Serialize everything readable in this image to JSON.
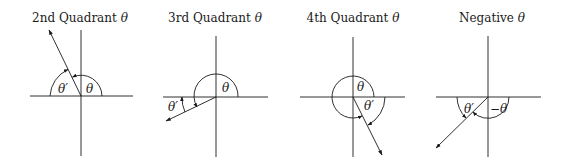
{
  "diagrams": [
    {
      "title": "2nd Quadrant",
      "title_symbol": "θ",
      "angle_label": "θ",
      "reference_label": "θ′"
    },
    {
      "title": "3rd Quadrant",
      "title_symbol": "θ",
      "angle_label": "θ",
      "reference_label": "θ′"
    },
    {
      "title": "4th Quadrant",
      "title_symbol": "θ",
      "angle_label": "θ",
      "reference_label": "θ′"
    },
    {
      "title": "Negative",
      "title_symbol": "θ",
      "angle_label": "−θ",
      "reference_label": "θ′"
    }
  ],
  "colors": {
    "stroke": "#1a1a1a",
    "background": "#ffffff"
  }
}
